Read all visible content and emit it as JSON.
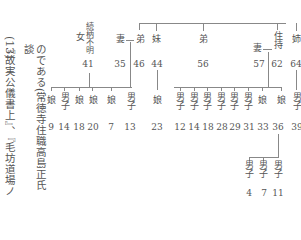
{
  "text_columns": [
    {
      "text": "(13)",
      "note": "footnote marker"
    },
    {
      "text": "のである(常徳寺住職高島正氏談"
    },
    {
      "text": "『故実公儀書上』、『毛坊道場ノ"
    }
  ],
  "genealogy": {
    "top_generation": [
      {
        "label": "女",
        "note": "続柄不明",
        "age": "41"
      },
      {
        "label": "妻",
        "spouse_of": "弟",
        "age": "35"
      },
      {
        "label": "弟",
        "age": "46"
      },
      {
        "label": "妹",
        "age": "44"
      },
      {
        "label": "弟",
        "age": "56"
      },
      {
        "label": "妻",
        "spouse_of": "住持",
        "age": "57"
      },
      {
        "label": "住持",
        "age": "62"
      },
      {
        "label": "姉",
        "age": "64"
      }
    ],
    "children_of_41": [
      {
        "label": "娘",
        "age": "9"
      },
      {
        "label": "男子",
        "age": "14"
      },
      {
        "label": "娘",
        "age": "18"
      },
      {
        "label": "娘",
        "age": "20"
      }
    ],
    "children_of_46": [
      {
        "label": "娘",
        "age": "7"
      },
      {
        "label": "男子",
        "age": "13"
      }
    ],
    "children_of_44": [
      {
        "label": "娘",
        "age": "23"
      }
    ],
    "children_of_62": [
      {
        "label": "男子",
        "age": "12"
      },
      {
        "label": "男子",
        "age": "14"
      },
      {
        "label": "男子",
        "age": "18"
      },
      {
        "label": "男子",
        "age": "28"
      },
      {
        "label": "男子",
        "age": "29"
      },
      {
        "label": "男子",
        "age": "31"
      },
      {
        "label": "娘",
        "age": "33"
      },
      {
        "label": "娘",
        "age": "36"
      }
    ],
    "children_of_64": [
      {
        "label": "男子",
        "age": "39"
      }
    ],
    "grandchildren_of_36": [
      {
        "label": "男子",
        "age": "4"
      },
      {
        "label": "男子",
        "age": "7"
      },
      {
        "label": "男子",
        "age": "11"
      }
    ],
    "labels": {
      "onna": "女",
      "zokugara_fumei": "続柄不明",
      "tsuma": "妻",
      "otouto": "弟",
      "imouto": "妹",
      "juji": "住持",
      "ane": "姉",
      "musume": "娘",
      "danshi": "男子"
    }
  }
}
